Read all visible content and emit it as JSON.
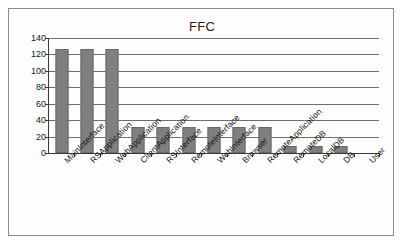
{
  "chart_data": {
    "type": "bar",
    "title": "FFC",
    "xlabel": "",
    "ylabel": "",
    "ylim": [
      0,
      140
    ],
    "ytick_step": 20,
    "yticks": [
      140,
      120,
      100,
      80,
      60,
      40,
      20,
      0
    ],
    "grid": true,
    "legend": null,
    "bar_color": "#7f7f7f",
    "categories": [
      "MainInterface",
      "RSApplication",
      "WebApplication",
      "ClientApplication",
      "RSInterface",
      "RemoteInterface",
      "WebInterface",
      "Browser",
      "RemoteApplication",
      "RemoteDB",
      "LocalDB",
      "DB",
      "User"
    ],
    "values": [
      127,
      127,
      127,
      32,
      32,
      32,
      32,
      32,
      32,
      8,
      8,
      8,
      0
    ]
  }
}
